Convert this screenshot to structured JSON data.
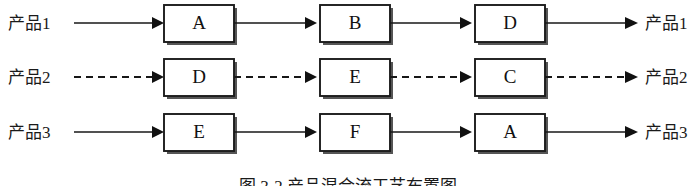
{
  "figure": {
    "caption": "图 3-2  产品混合流工艺布置图",
    "background_color": "#ffffff",
    "line_color": "#171717"
  },
  "rows": [
    {
      "id": "row-1",
      "input_label": "产品1",
      "output_label": "产品2",
      "line_style": "solid",
      "stations": [
        "A",
        "B",
        "D"
      ]
    },
    {
      "id": "row-2",
      "input_label": "产品2",
      "output_label": "产品2",
      "line_style": "dashed",
      "stations": [
        "D",
        "E",
        "C"
      ]
    },
    {
      "id": "row-3",
      "input_label": "产品3",
      "output_label": "产品3",
      "line_style": "solid",
      "stations": [
        "E",
        "F",
        "A"
      ]
    }
  ],
  "labels": {
    "row1_input": "产品1",
    "row1_output": "产品1",
    "row2_input": "产品2",
    "row2_output": "产品2",
    "row3_input": "产品3",
    "row3_output": "产品3",
    "r1c1": "A",
    "r1c2": "B",
    "r1c3": "D",
    "r2c1": "D",
    "r2c2": "E",
    "r2c3": "C",
    "r3c1": "E",
    "r3c2": "F",
    "r3c3": "A"
  }
}
